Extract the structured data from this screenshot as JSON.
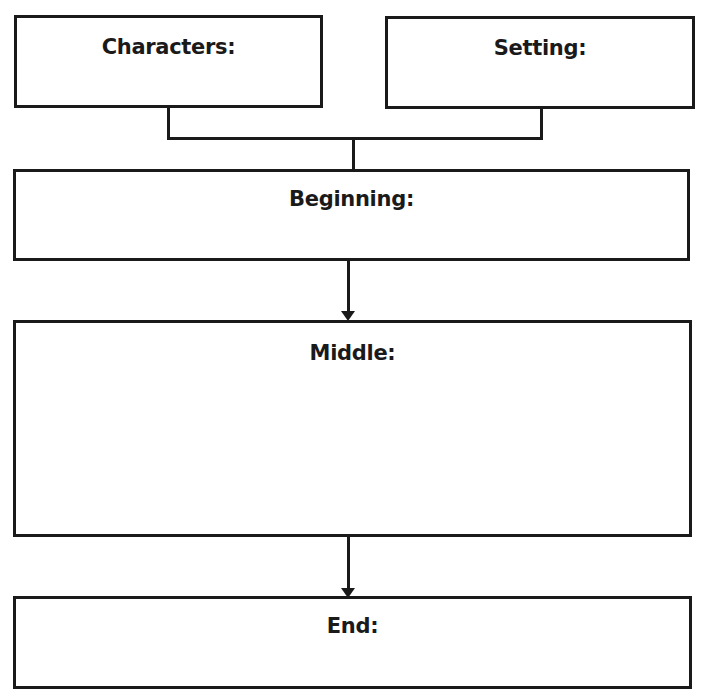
{
  "diagram": {
    "type": "story-map graphic organizer",
    "boxes": {
      "characters": {
        "label": "Characters:"
      },
      "setting": {
        "label": "Setting:"
      },
      "beginning": {
        "label": "Beginning:"
      },
      "middle": {
        "label": "Middle:"
      },
      "end": {
        "label": "End:"
      }
    },
    "connections": [
      {
        "from": "characters",
        "to": "beginning",
        "style": "bracket-line"
      },
      {
        "from": "setting",
        "to": "beginning",
        "style": "bracket-line"
      },
      {
        "from": "beginning",
        "to": "middle",
        "style": "arrow"
      },
      {
        "from": "middle",
        "to": "end",
        "style": "arrow"
      }
    ],
    "colors": {
      "stroke": "#1a1a1a",
      "background": "#ffffff"
    }
  }
}
